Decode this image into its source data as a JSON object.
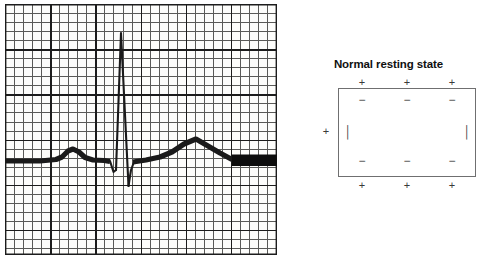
{
  "figure": {
    "panels": [
      {
        "id": "ecg",
        "name": "ecg-waveform-panel",
        "grid": {
          "minor_square_px": 9,
          "major_every_minor": 5,
          "major_color": "#1c1c1c",
          "minor_color": "#5a5a58",
          "background": "#fdfdfb"
        },
        "trace": {
          "color": "#1a1a1a",
          "baseline_label": "isoelectric line",
          "features": [
            {
              "name": "P wave",
              "peak_x": 72,
              "peak_y": 149
            },
            {
              "name": "Q deflection",
              "trough_x": 112,
              "trough_y": 172
            },
            {
              "name": "R wave",
              "peak_x": 121,
              "peak_y": 33
            },
            {
              "name": "S deflection",
              "trough_x": 128,
              "trough_y": 186
            },
            {
              "name": "T wave",
              "peak_x": 196,
              "peak_y": 139
            },
            {
              "name": "terminal bar",
              "x_start": 233,
              "x_end": 277,
              "y": 160
            }
          ]
        }
      },
      {
        "id": "membrane",
        "name": "membrane-polarization-panel",
        "title": "Normal resting state",
        "box_border_color": "#6f6f70",
        "outer_charge": "+",
        "inner_charge": "−",
        "lateral_charge": "+",
        "lateral_inner_mark": "│",
        "charges": {
          "outer_top": [
            "+",
            "+",
            "+"
          ],
          "inner_top": [
            "−",
            "−",
            "−"
          ],
          "inner_bottom": [
            "−",
            "−",
            "−"
          ],
          "outer_bottom": [
            "+",
            "+",
            "+"
          ],
          "left_outer": "+",
          "left_inner": "│",
          "right_inner": "│"
        }
      }
    ]
  }
}
